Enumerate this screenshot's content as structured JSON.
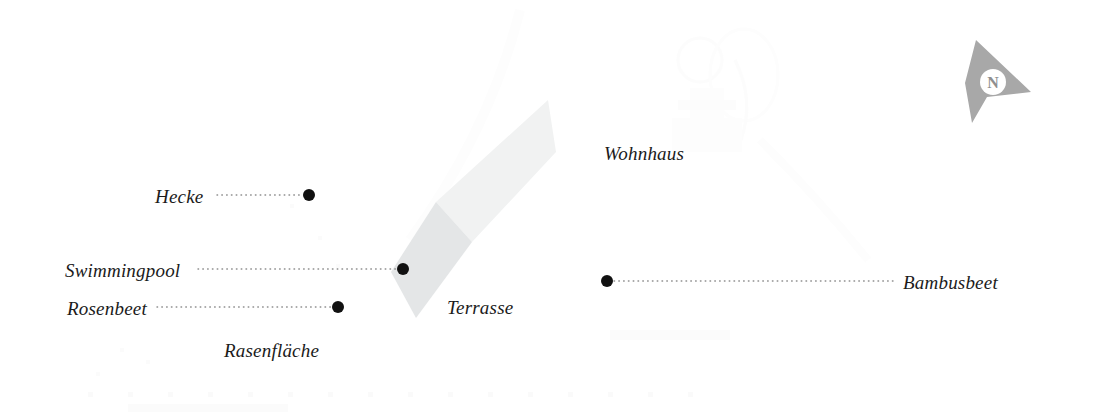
{
  "plan": {
    "title": "Gartenplan",
    "canvas": {
      "width": 1095,
      "height": 418
    },
    "background_color": "#ffffff",
    "ink_color": "#1b1b1b",
    "leader_color": "#8d8d8d",
    "terrace_upper_color": "#f1f2f2",
    "terrace_lower_color": "#e4e6e7",
    "compass_color": "#a8a8a8"
  },
  "compass": {
    "name": "north-arrow",
    "letter": "N",
    "letter_color": "#8f8f8f",
    "body_color": "#a8a8a8",
    "disc_color": "#ffffff"
  },
  "areas": [
    {
      "id": "terrasse",
      "label": "Terrasse",
      "label_x": 447,
      "label_y": 298,
      "shape": "diagonal-band"
    }
  ],
  "free_labels": [
    {
      "id": "wohnhaus",
      "label": "Wohnhaus",
      "x": 604,
      "y": 144
    },
    {
      "id": "rasenflaeche",
      "label": "Rasenfläche",
      "x": 224,
      "y": 341
    },
    {
      "id": "terrasse",
      "label": "Terrasse",
      "x": 447,
      "y": 298
    }
  ],
  "callouts": [
    {
      "id": "hecke",
      "label": "Hecke",
      "label_side": "left",
      "label_x": 155,
      "label_y": 187,
      "leader_x1": 217,
      "leader_x2": 303,
      "leader_y": 195,
      "marker_x": 309,
      "marker_y": 195,
      "marker_r": 6
    },
    {
      "id": "swimmingpool",
      "label": "Swimmingpool",
      "label_side": "left",
      "label_x": 65,
      "label_y": 261,
      "leader_x1": 198,
      "leader_x2": 397,
      "leader_y": 269,
      "marker_x": 403,
      "marker_y": 269,
      "marker_r": 6
    },
    {
      "id": "rosenbeet",
      "label": "Rosenbeet",
      "label_side": "left",
      "label_x": 67,
      "label_y": 299,
      "leader_x1": 157,
      "leader_x2": 332,
      "leader_y": 307,
      "marker_x": 338,
      "marker_y": 307,
      "marker_r": 6
    },
    {
      "id": "bambusbeet",
      "label": "Bambusbeet",
      "label_side": "right",
      "label_x": 903,
      "label_y": 273,
      "leader_x1": 614,
      "leader_x2": 897,
      "leader_y": 281,
      "marker_x": 607,
      "marker_y": 281,
      "marker_r": 6
    }
  ]
}
